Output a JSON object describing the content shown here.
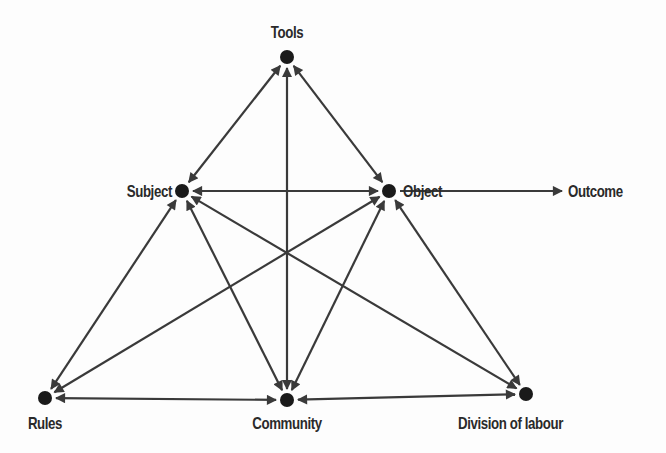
{
  "diagram": {
    "type": "activity-system-triangle",
    "colors": {
      "line": "#3a3a3a",
      "node": "#1a1a1a",
      "text": "#2a2a2a",
      "background": "#fdfdfd"
    },
    "nodes": [
      {
        "id": "tools",
        "label": "Tools",
        "x": 287,
        "y": 57
      },
      {
        "id": "subject",
        "label": "Subject",
        "x": 182,
        "y": 191
      },
      {
        "id": "object",
        "label": "Object",
        "x": 389,
        "y": 191
      },
      {
        "id": "rules",
        "label": "Rules",
        "x": 45,
        "y": 398
      },
      {
        "id": "community",
        "label": "Community",
        "x": 287,
        "y": 400
      },
      {
        "id": "division",
        "label": "Division of labour",
        "x": 526,
        "y": 394
      }
    ],
    "outcome": {
      "label": "Outcome"
    },
    "edges": [
      {
        "from": "tools",
        "to": "subject",
        "type": "bidirectional"
      },
      {
        "from": "tools",
        "to": "object",
        "type": "bidirectional"
      },
      {
        "from": "tools",
        "to": "community",
        "type": "bidirectional"
      },
      {
        "from": "subject",
        "to": "object",
        "type": "bidirectional"
      },
      {
        "from": "subject",
        "to": "rules",
        "type": "bidirectional"
      },
      {
        "from": "subject",
        "to": "community",
        "type": "bidirectional"
      },
      {
        "from": "subject",
        "to": "division",
        "type": "bidirectional"
      },
      {
        "from": "object",
        "to": "rules",
        "type": "bidirectional"
      },
      {
        "from": "object",
        "to": "community",
        "type": "bidirectional"
      },
      {
        "from": "object",
        "to": "division",
        "type": "bidirectional"
      },
      {
        "from": "rules",
        "to": "community",
        "type": "bidirectional"
      },
      {
        "from": "community",
        "to": "division",
        "type": "bidirectional"
      },
      {
        "from": "object",
        "to": "outcome",
        "type": "directed"
      }
    ]
  }
}
